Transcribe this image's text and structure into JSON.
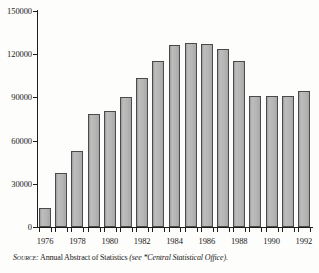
{
  "chart_data": {
    "type": "bar",
    "title": "",
    "subtitle": "",
    "xlabel": "",
    "ylabel": "",
    "categories": [
      "1976",
      "1977",
      "1978",
      "1979",
      "1980",
      "1981",
      "1982",
      "1983",
      "1984",
      "1985",
      "1986",
      "1987",
      "1988",
      "1989",
      "1990",
      "1991",
      "1992"
    ],
    "values": [
      13200,
      37600,
      52500,
      78200,
      80700,
      90000,
      103500,
      115500,
      126500,
      128000,
      127000,
      123500,
      115500,
      91300,
      91300,
      91200,
      94500
    ],
    "ylim": [
      0,
      150000
    ],
    "yticks": [
      0,
      30000,
      60000,
      90000,
      120000,
      150000
    ],
    "ytick_labels": [
      "0",
      "30000",
      "60000",
      "90000",
      "120000",
      "150000"
    ],
    "xtick_labels": [
      "1976",
      "1978",
      "1980",
      "1982",
      "1984",
      "1986",
      "1988",
      "1990",
      "1992"
    ],
    "xtick_categories": [
      "1976",
      "1978",
      "1980",
      "1982",
      "1984",
      "1986",
      "1988",
      "1990",
      "1992"
    ],
    "grid": false,
    "legend": null,
    "bar_color": "#b6b6b6",
    "bar_edge_color": "#4a4a4a",
    "axis_color": "#1d1d1d"
  },
  "source": {
    "label": "Source:",
    "main": "Annual Abstract of Statistics",
    "paren": "(see *Central Statistical Office)."
  }
}
